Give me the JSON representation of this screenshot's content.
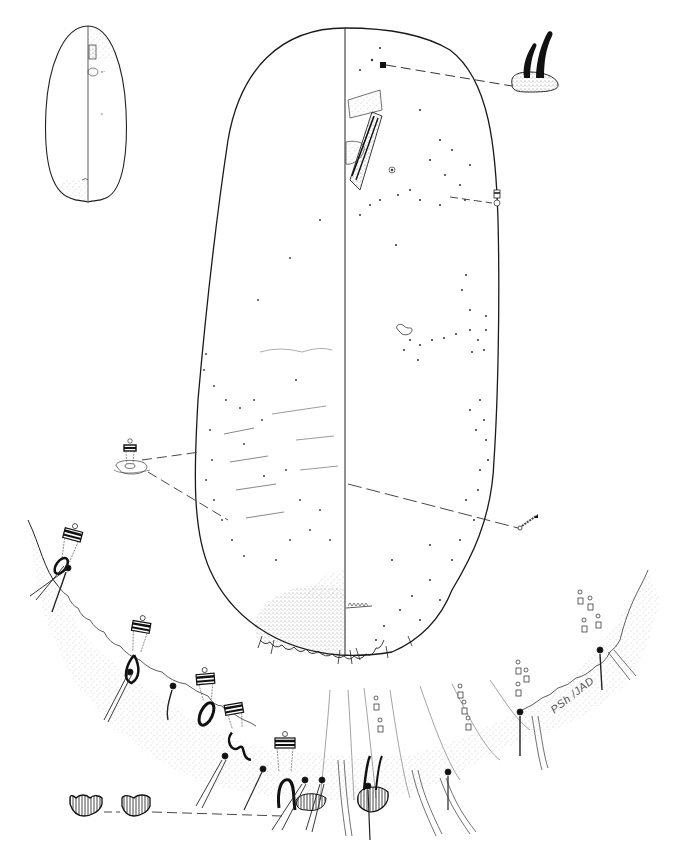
{
  "figure": {
    "panels": [
      {
        "id": "habitus-inset",
        "label": "whole-body outline inset"
      },
      {
        "id": "main-body",
        "label": "body, dorsum (right) and venter (left)"
      },
      {
        "id": "margin-enlargement",
        "label": "enlarged posterior margin (pygidium)"
      },
      {
        "id": "seta-detail",
        "label": "dorsal seta pair on base"
      },
      {
        "id": "duct-detail-left",
        "label": "tubular duct detail"
      },
      {
        "id": "duct-detail-right",
        "label": "small duct detail"
      },
      {
        "id": "lobe-details",
        "label": "two lobe details"
      },
      {
        "id": "pore-detail",
        "label": "pore detail"
      }
    ],
    "signature": "PSh /JAD",
    "caption_visible": false
  },
  "colors": {
    "ink": "#111111",
    "stipple": "#9a9a9a",
    "background": "#ffffff"
  }
}
